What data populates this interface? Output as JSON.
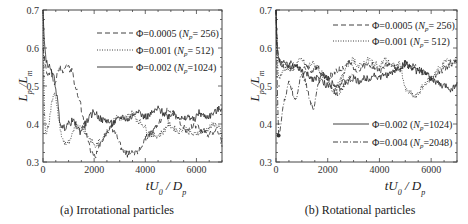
{
  "chart_data": [
    {
      "type": "line",
      "title": "",
      "caption": "(a) Irrotational particles",
      "xlabel": "tU0 / Dp",
      "ylabel": "Lp / Lm",
      "xlim": [
        0,
        7000
      ],
      "ylim": [
        0.3,
        0.7
      ],
      "xticks": [
        "0",
        "2000",
        "4000",
        "6000"
      ],
      "yticks": [
        "0.3",
        "0.4",
        "0.5",
        "0.6",
        "0.7"
      ],
      "grid": false,
      "legend_position": "upper right",
      "series": [
        {
          "name": "Φ=0.0005 (Np= 256)",
          "style": "dashed",
          "x": [
            0,
            50,
            100,
            150,
            250,
            350,
            450,
            550,
            650,
            750,
            850,
            950,
            1050,
            1150,
            1250,
            1350,
            1450,
            1550,
            1650,
            1750,
            1850,
            1950,
            2050,
            2150,
            2300,
            2500,
            2700,
            2900,
            3100,
            3300,
            3500,
            3700,
            3900,
            4100,
            4300,
            4500,
            4700,
            4900,
            5100,
            5300,
            5500,
            5700,
            5900,
            6100,
            6300,
            6500,
            6700,
            6900,
            7000
          ],
          "values": [
            0.6,
            0.58,
            0.55,
            0.53,
            0.53,
            0.54,
            0.5,
            0.53,
            0.55,
            0.54,
            0.55,
            0.56,
            0.54,
            0.54,
            0.5,
            0.48,
            0.46,
            0.42,
            0.39,
            0.36,
            0.33,
            0.32,
            0.31,
            0.34,
            0.36,
            0.38,
            0.39,
            0.37,
            0.33,
            0.32,
            0.33,
            0.32,
            0.35,
            0.37,
            0.38,
            0.4,
            0.42,
            0.44,
            0.43,
            0.41,
            0.39,
            0.38,
            0.4,
            0.39,
            0.38,
            0.37,
            0.38,
            0.38,
            0.34
          ]
        },
        {
          "name": "Φ=0.001 (Np= 512)",
          "style": "dotted",
          "x": [
            0,
            50,
            100,
            150,
            250,
            350,
            450,
            550,
            650,
            750,
            850,
            950,
            1050,
            1150,
            1250,
            1350,
            1450,
            1550,
            1650,
            1750,
            1850,
            1950,
            2050,
            2150,
            2300,
            2500,
            2700,
            2900,
            3100,
            3300,
            3500,
            3700,
            3900,
            4100,
            4300,
            4500,
            4700,
            4900,
            5100,
            5300,
            5500,
            5700,
            5900,
            6100,
            6300,
            6500,
            6700,
            6900,
            7000
          ],
          "values": [
            0.7,
            0.45,
            0.37,
            0.38,
            0.41,
            0.46,
            0.49,
            0.44,
            0.4,
            0.36,
            0.35,
            0.35,
            0.35,
            0.37,
            0.4,
            0.4,
            0.39,
            0.39,
            0.38,
            0.37,
            0.36,
            0.35,
            0.34,
            0.35,
            0.36,
            0.38,
            0.4,
            0.42,
            0.41,
            0.42,
            0.43,
            0.41,
            0.4,
            0.38,
            0.37,
            0.37,
            0.38,
            0.4,
            0.39,
            0.38,
            0.39,
            0.38,
            0.37,
            0.38,
            0.38,
            0.39,
            0.4,
            0.39,
            0.36
          ]
        },
        {
          "name": "Φ=0.002 (Np=1024)",
          "style": "solid",
          "x": [
            0,
            50,
            100,
            150,
            250,
            350,
            450,
            550,
            650,
            750,
            850,
            950,
            1050,
            1150,
            1250,
            1350,
            1450,
            1550,
            1650,
            1750,
            1850,
            1950,
            2050,
            2150,
            2300,
            2500,
            2700,
            2900,
            3100,
            3300,
            3500,
            3700,
            3900,
            4100,
            4300,
            4500,
            4700,
            4900,
            5100,
            5300,
            5500,
            5700,
            5900,
            6100,
            6300,
            6500,
            6700,
            6900,
            7000
          ],
          "values": [
            0.7,
            0.62,
            0.58,
            0.56,
            0.55,
            0.53,
            0.52,
            0.47,
            0.41,
            0.39,
            0.39,
            0.4,
            0.4,
            0.41,
            0.4,
            0.39,
            0.38,
            0.39,
            0.4,
            0.41,
            0.42,
            0.43,
            0.43,
            0.42,
            0.41,
            0.41,
            0.4,
            0.41,
            0.42,
            0.41,
            0.42,
            0.44,
            0.42,
            0.42,
            0.43,
            0.44,
            0.43,
            0.42,
            0.43,
            0.42,
            0.41,
            0.42,
            0.41,
            0.43,
            0.42,
            0.42,
            0.43,
            0.44,
            0.44
          ]
        }
      ]
    },
    {
      "type": "line",
      "title": "",
      "caption": "(b) Rotational particles",
      "xlabel": "tU0 / Dp",
      "ylabel": "Lp / Lm",
      "xlim": [
        0,
        7000
      ],
      "ylim": [
        0.3,
        0.7
      ],
      "xticks": [
        "0",
        "2000",
        "4000",
        "6000"
      ],
      "yticks": [
        "0.3",
        "0.4",
        "0.5",
        "0.6",
        "0.7"
      ],
      "grid": false,
      "legend_position": "upper right and lower right",
      "series": [
        {
          "name": "Φ=0.0005 (Np= 256)",
          "style": "dashed",
          "x": [
            0,
            50,
            100,
            200,
            400,
            600,
            800,
            1000,
            1200,
            1400,
            1600,
            1800,
            2000,
            2200,
            2400,
            2600,
            2800,
            3000,
            3200,
            3400,
            3600,
            3800,
            4000,
            4200,
            4400,
            4600,
            4800,
            5000,
            5200,
            5400,
            5600,
            5800,
            6000,
            6200,
            6400,
            6600,
            6800,
            7000
          ],
          "values": [
            0.7,
            0.6,
            0.57,
            0.56,
            0.55,
            0.56,
            0.55,
            0.54,
            0.55,
            0.54,
            0.55,
            0.53,
            0.52,
            0.53,
            0.54,
            0.55,
            0.56,
            0.55,
            0.54,
            0.55,
            0.56,
            0.55,
            0.54,
            0.55,
            0.56,
            0.55,
            0.54,
            0.56,
            0.55,
            0.55,
            0.54,
            0.53,
            0.52,
            0.53,
            0.54,
            0.55,
            0.56,
            0.56
          ]
        },
        {
          "name": "Φ=0.001 (Np= 512)",
          "style": "dotted",
          "x": [
            0,
            50,
            100,
            200,
            400,
            600,
            800,
            1000,
            1200,
            1400,
            1600,
            1800,
            2000,
            2200,
            2400,
            2600,
            2800,
            3000,
            3200,
            3400,
            3600,
            3800,
            4000,
            4200,
            4400,
            4600,
            4800,
            5000,
            5200,
            5400,
            5600,
            5800,
            6000,
            6200,
            6400,
            6600,
            6800,
            7000
          ],
          "values": [
            0.7,
            0.58,
            0.52,
            0.53,
            0.55,
            0.54,
            0.56,
            0.57,
            0.55,
            0.56,
            0.55,
            0.53,
            0.51,
            0.49,
            0.5,
            0.53,
            0.56,
            0.57,
            0.55,
            0.56,
            0.57,
            0.56,
            0.55,
            0.57,
            0.56,
            0.55,
            0.56,
            0.49,
            0.48,
            0.47,
            0.49,
            0.51,
            0.52,
            0.54,
            0.55,
            0.57,
            0.56,
            0.57
          ]
        },
        {
          "name": "Φ=0.002 (Np=1024)",
          "style": "solid",
          "x": [
            0,
            50,
            100,
            200,
            400,
            600,
            800,
            1000,
            1200,
            1400,
            1600,
            1800,
            2000,
            2200,
            2400,
            2600,
            2800,
            3000,
            3200,
            3400,
            3600,
            3800,
            4000,
            4200,
            4400,
            4600,
            4800,
            5000,
            5200,
            5400,
            5600,
            5800,
            6000,
            6200,
            6400,
            6600,
            6800,
            7000
          ],
          "values": [
            0.7,
            0.6,
            0.57,
            0.56,
            0.56,
            0.55,
            0.55,
            0.54,
            0.53,
            0.52,
            0.52,
            0.51,
            0.5,
            0.51,
            0.5,
            0.51,
            0.51,
            0.52,
            0.51,
            0.52,
            0.52,
            0.53,
            0.52,
            0.53,
            0.53,
            0.54,
            0.55,
            0.56,
            0.55,
            0.54,
            0.54,
            0.53,
            0.52,
            0.51,
            0.5,
            0.5,
            0.49,
            0.51
          ]
        },
        {
          "name": "Φ=0.004 (Np=2048)",
          "style": "dashdot",
          "x": [
            0,
            50,
            100,
            150,
            250,
            350,
            450,
            550,
            650,
            750,
            850,
            950,
            1050,
            1150,
            1250,
            1350,
            1450,
            1550,
            1650,
            1800,
            2000,
            2200,
            2400,
            2600,
            2800,
            3000
          ],
          "values": [
            0.7,
            0.5,
            0.37,
            0.38,
            0.44,
            0.47,
            0.5,
            0.51,
            0.48,
            0.46,
            0.49,
            0.52,
            0.53,
            0.51,
            0.48,
            0.45,
            0.44,
            0.47,
            0.51,
            0.53,
            0.52,
            0.49,
            0.48,
            0.5,
            0.52,
            0.53
          ]
        }
      ]
    }
  ],
  "panels": [
    {
      "caption": "(a) Irrotational particles",
      "y_axis_title": "Lp /Lm",
      "x_axis_title": "tU0 / Dp",
      "legend": [
        {
          "label": "Φ=0.0005 (Np= 256)"
        },
        {
          "label": "Φ=0.001 (Np= 512)"
        },
        {
          "label": "Φ=0.002 (Np=1024)"
        }
      ]
    },
    {
      "caption": "(b) Rotational particles",
      "y_axis_title": "Lp /Lm",
      "x_axis_title": "tU0 / Dp",
      "legend": [
        {
          "label": "Φ=0.0005 (Np= 256)"
        },
        {
          "label": "Φ=0.001 (Np= 512)"
        },
        {
          "label": "Φ=0.002 (Np=1024)"
        },
        {
          "label": "Φ=0.004 (Np=2048)"
        }
      ]
    }
  ],
  "colors": {
    "line": "#2a2a2a",
    "axis": "#444444",
    "background": "#ffffff"
  }
}
